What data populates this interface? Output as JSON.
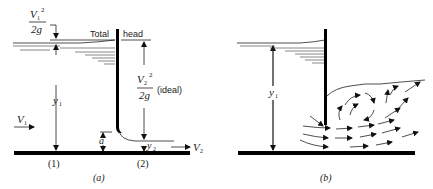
{
  "figure_a": {
    "caption": "(a)",
    "energy_label_left": "Total",
    "energy_label_right": "head",
    "v1_sq": "V",
    "v1_sub": "1",
    "v1_exp": "2",
    "two_g_1": "2g",
    "v2_sq": "V",
    "v2_sub": "2",
    "v2_exp": "2",
    "two_g_2": "2g",
    "ideal_note": "(ideal)",
    "v1_arrow_label": "V",
    "v1_arrow_sub": "1",
    "y1_label": "y",
    "y1_sub": "1",
    "a_label": "a",
    "y2_label": "y",
    "y2_sub": "2",
    "v2_arrow_label": "V",
    "v2_arrow_sub": "2",
    "section_1": "(1)",
    "section_2": "(2)"
  },
  "figure_b": {
    "caption": "(b)",
    "y1_label": "y",
    "y1_sub": "1"
  }
}
